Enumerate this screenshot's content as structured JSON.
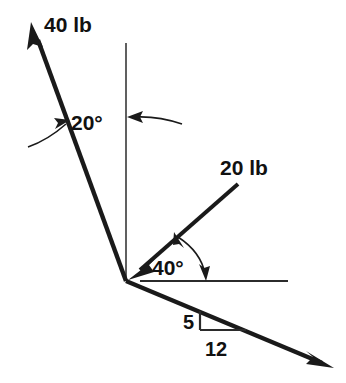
{
  "diagram": {
    "background_color": "#ffffff",
    "stroke_color": "#1a1a1a",
    "origin": {
      "label": "vertex",
      "x": 126,
      "y": 281
    },
    "vectors": [
      {
        "name": "force-40lb",
        "label": "40 lb",
        "magnitude": 40,
        "unit": "lb",
        "direction": "up-left",
        "arrow_at": "tip",
        "tail": {
          "x": 126,
          "y": 281
        },
        "tip": {
          "x": 32,
          "y": 24
        },
        "label_x": 44,
        "label_y": 32,
        "angle_from_vertical_deg": 20
      },
      {
        "name": "force-20lb",
        "label": "20 lb",
        "magnitude": 20,
        "unit": "lb",
        "direction": "toward-origin-from-upper-right",
        "arrow_at": "tail",
        "tail": {
          "x": 238,
          "y": 184
        },
        "tip": {
          "x": 132,
          "y": 277
        },
        "label_x": 220,
        "label_y": 175,
        "angle_from_horizontal_deg": 40
      },
      {
        "name": "force-slope-vector",
        "label": "",
        "direction": "down-right",
        "arrow_at": "tip",
        "tail": {
          "x": 126,
          "y": 281
        },
        "tip": {
          "x": 332,
          "y": 367
        },
        "slope_rise": 5,
        "slope_run": 12
      }
    ],
    "reference_lines": [
      {
        "name": "vertical-reference-line",
        "x1": 126,
        "y1": 43,
        "x2": 126,
        "y2": 281
      },
      {
        "name": "horizontal-reference-line",
        "x1": 140,
        "y1": 281,
        "x2": 288,
        "y2": 281
      }
    ],
    "angles": [
      {
        "name": "angle-20-degrees",
        "label": "20°",
        "value": 20,
        "label_x": 71,
        "label_y": 130,
        "between": [
          "force-40lb",
          "vertical-reference-line"
        ]
      },
      {
        "name": "angle-40-degrees",
        "label": "40°",
        "value": 40,
        "label_x": 152,
        "label_y": 275,
        "between": [
          "force-20lb",
          "horizontal-reference-line"
        ]
      }
    ],
    "slope_triangle": {
      "name": "slope-triangle-5-12",
      "rise_label": "5",
      "run_label": "12",
      "rise": 5,
      "run": 12,
      "corner_x": 200,
      "corner_y": 330,
      "top_x": 200,
      "top_y": 311,
      "right_x": 246,
      "right_y": 330,
      "rise_label_x": 183,
      "rise_label_y": 329,
      "run_label_x": 205,
      "run_label_y": 356
    }
  }
}
